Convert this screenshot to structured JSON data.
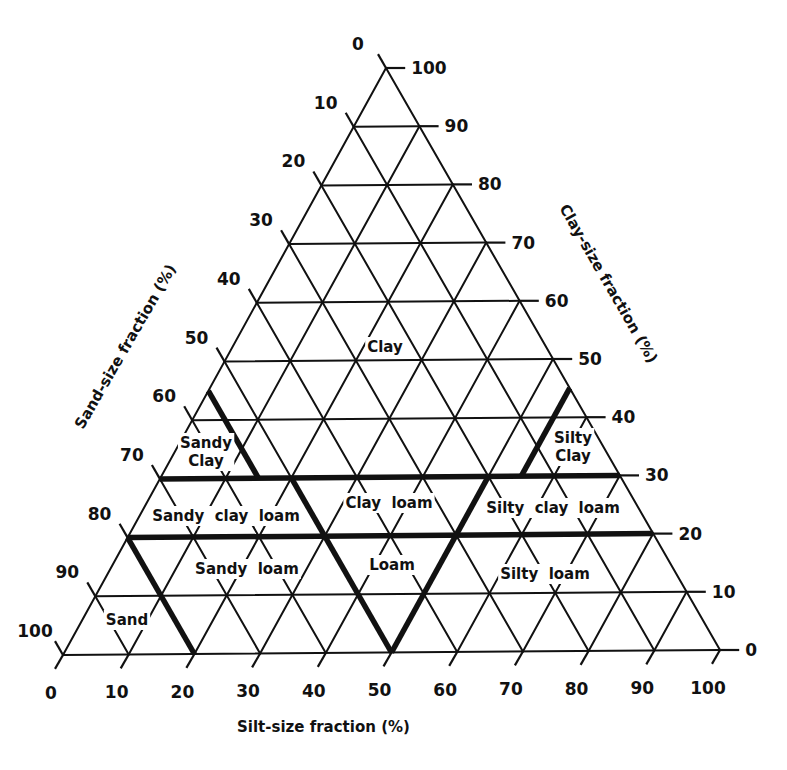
{
  "diagram": {
    "type": "ternary-soil-texture-triangle",
    "geometry": {
      "left_corner": [
        63,
        655
      ],
      "right_corner": [
        720,
        650
      ],
      "apex": [
        386,
        68
      ]
    },
    "axes": {
      "sand": {
        "title": "Sand-size fraction (%)",
        "ticks": [
          0,
          10,
          20,
          30,
          40,
          50,
          60,
          70,
          80,
          90,
          100
        ]
      },
      "clay": {
        "title": "Clay-size fraction (%)",
        "ticks": [
          0,
          10,
          20,
          30,
          40,
          50,
          60,
          70,
          80,
          90,
          100
        ]
      },
      "silt": {
        "title": "Silt-size fraction (%)",
        "ticks": [
          0,
          10,
          20,
          30,
          40,
          50,
          60,
          70,
          80,
          90,
          100
        ]
      }
    },
    "regions": [
      {
        "name": "Clay",
        "lines": [
          "Clay"
        ],
        "x": 385,
        "y": 352
      },
      {
        "name": "Sandy Clay",
        "lines": [
          "Sandy",
          "Clay"
        ],
        "x": 206,
        "y": 448
      },
      {
        "name": "Silty Clay",
        "lines": [
          "Silty",
          "Clay"
        ],
        "x": 573,
        "y": 443
      },
      {
        "name": "Sandy clay loam",
        "lines": [
          "Sandy  clay  loam"
        ],
        "x": 226,
        "y": 521
      },
      {
        "name": "Clay loam",
        "lines": [
          "Clay  loam"
        ],
        "x": 389,
        "y": 508
      },
      {
        "name": "Silty clay loam",
        "lines": [
          "Silty  clay  loam"
        ],
        "x": 553,
        "y": 513
      },
      {
        "name": "Sandy loam",
        "lines": [
          "Sandy  loam"
        ],
        "x": 247,
        "y": 574
      },
      {
        "name": "Loam",
        "lines": [
          "Loam"
        ],
        "x": 392,
        "y": 570
      },
      {
        "name": "Silty loam",
        "lines": [
          "Silty  loam"
        ],
        "x": 545,
        "y": 579
      },
      {
        "name": "Sand",
        "lines": [
          "Sand"
        ],
        "x": 127,
        "y": 625
      }
    ],
    "boundaries": [
      {
        "label": "clay-30",
        "from": {
          "clay": 30,
          "silt": 0
        },
        "to": {
          "clay": 30,
          "silt": 70
        }
      },
      {
        "label": "clay-20",
        "from": {
          "clay": 20,
          "silt": 0
        },
        "to": {
          "clay": 20,
          "silt": 80
        }
      },
      {
        "label": "sandy-clay",
        "from": {
          "clay": 45,
          "silt": 0
        },
        "to": {
          "clay": 30,
          "silt": 15
        }
      },
      {
        "label": "silty-clay",
        "from": {
          "clay": 45,
          "silt": 55
        },
        "to": {
          "clay": 30,
          "silt": 55
        }
      },
      {
        "label": "loam-left",
        "from": {
          "clay": 30,
          "silt": 20
        },
        "to": {
          "clay": 0,
          "silt": 50
        }
      },
      {
        "label": "loam-right",
        "from": {
          "clay": 0,
          "silt": 50
        },
        "to": {
          "clay": 30,
          "silt": 50
        }
      },
      {
        "label": "sand",
        "from": {
          "clay": 20,
          "silt": 0
        },
        "to": {
          "clay": 0,
          "silt": 20
        }
      }
    ]
  }
}
